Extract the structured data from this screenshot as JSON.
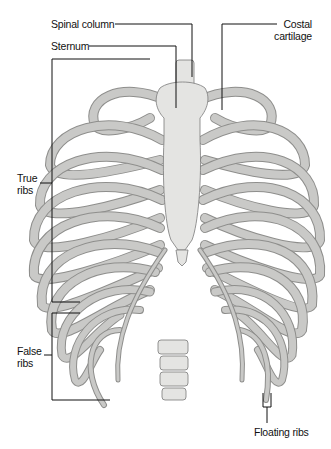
{
  "figure": {
    "labels": {
      "spinal_column": "Spinal column",
      "sternum": "Sternum",
      "costal_cartilage_line1": "Costal",
      "costal_cartilage_line2": "cartilage",
      "true_ribs_line1": "True",
      "true_ribs_line2": "ribs",
      "false_ribs_line1": "False",
      "false_ribs_line2": "ribs",
      "floating_ribs": "Floating ribs"
    },
    "colors": {
      "background": "#ffffff",
      "bone": "#e4e4e2",
      "bone_shadow": "#8e8e8c",
      "leader_line": "#111111"
    }
  }
}
